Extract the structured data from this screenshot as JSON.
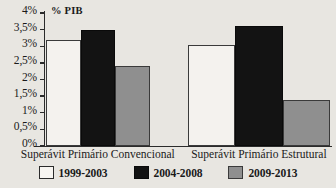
{
  "chart_data": {
    "type": "bar",
    "title": "",
    "xlabel": "",
    "ylabel": "% PIB",
    "ylim": [
      0,
      4
    ],
    "grid": false,
    "legend_position": "bottom",
    "categories": [
      "Superávit Primário Convencional",
      "Superávit Primário Estrutural"
    ],
    "series": [
      {
        "name": "1999-2003",
        "color": "#f4f2ee",
        "values": [
          3.2,
          3.05
        ]
      },
      {
        "name": "2004-2008",
        "color": "#131313",
        "values": [
          3.5,
          3.6
        ]
      },
      {
        "name": "2009-2013",
        "color": "#8f8f8f",
        "values": [
          2.4,
          1.37
        ]
      }
    ],
    "yticks": [
      {
        "value": 4,
        "label": "4%"
      },
      {
        "value": 3.5,
        "label": "3,5%"
      },
      {
        "value": 3,
        "label": "3%"
      },
      {
        "value": 2.5,
        "label": "2,5%"
      },
      {
        "value": 2,
        "label": "2%"
      },
      {
        "value": 1.5,
        "label": "1,5%"
      },
      {
        "value": 1,
        "label": "1%"
      },
      {
        "value": 0.5,
        "label": "0,5%"
      },
      {
        "value": 0,
        "label": "0%"
      }
    ]
  }
}
